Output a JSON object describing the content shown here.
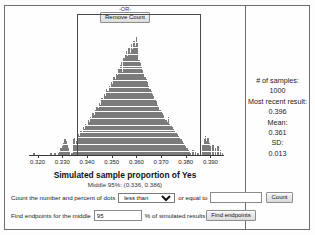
{
  "stats_panel": {
    "samples_label": "# of samples:",
    "samples_value": "1000",
    "recent_label": "Most recent result:",
    "recent_value": "0.396",
    "mean_label": "Mean:",
    "mean_value": "0.361",
    "sd_label": "SD:",
    "sd_value": "0.013"
  },
  "controls": {
    "count_prefix": "Count the number and percent of dots",
    "comparison_selected": "less than",
    "comparison_options": [
      "less than",
      "greater than"
    ],
    "or_equal_to": "or equal to",
    "count_value": "",
    "count_button": "Count",
    "or_divider": "-OR-",
    "find_prefix": "Find endpoints for the middle",
    "middle_pct": "95",
    "find_suffix": "% of simulated results",
    "find_button": "Find endpoints",
    "remove_button": "Remove Count"
  },
  "chart_data": {
    "type": "bar",
    "title": "Simulated sample proportion of Yes",
    "subtitle": "Middle 95%: (0.336, 0.386)",
    "xlabel": "Simulated sample proportion of Yes",
    "ylabel": "",
    "grid": false,
    "legend": "none",
    "xlim": [
      0.3165,
      0.3955
    ],
    "tick_values": [
      0.32,
      0.33,
      0.34,
      0.35,
      0.36,
      0.37,
      0.38,
      0.39
    ],
    "tick_labels": [
      "0.320",
      "0.330",
      "0.340",
      "0.350",
      "0.360",
      "0.370",
      "0.380",
      "0.390"
    ],
    "selection": {
      "low": 0.3358,
      "high": 0.3862,
      "label": "Middle 95%: (0.336, 0.386)"
    },
    "dot_value": 1,
    "bin_width": 0.001,
    "x": [
      0.3185,
      0.3255,
      0.327,
      0.3285,
      0.329,
      0.3295,
      0.33,
      0.3305,
      0.331,
      0.3315,
      0.332,
      0.3325,
      0.333,
      0.334,
      0.3345,
      0.335,
      0.3355,
      0.336,
      0.3365,
      0.337,
      0.3375,
      0.338,
      0.3385,
      0.339,
      0.3395,
      0.34,
      0.3405,
      0.341,
      0.3415,
      0.342,
      0.3425,
      0.343,
      0.3435,
      0.344,
      0.3445,
      0.345,
      0.3455,
      0.346,
      0.3465,
      0.347,
      0.3475,
      0.348,
      0.3485,
      0.349,
      0.3495,
      0.35,
      0.3505,
      0.351,
      0.3515,
      0.352,
      0.3525,
      0.353,
      0.3535,
      0.354,
      0.3545,
      0.355,
      0.3555,
      0.356,
      0.3565,
      0.357,
      0.3575,
      0.358,
      0.3585,
      0.359,
      0.3595,
      0.36,
      0.3605,
      0.361,
      0.3615,
      0.362,
      0.3625,
      0.363,
      0.3635,
      0.364,
      0.3645,
      0.365,
      0.3655,
      0.366,
      0.3665,
      0.367,
      0.3675,
      0.368,
      0.3685,
      0.369,
      0.3695,
      0.37,
      0.3705,
      0.371,
      0.3715,
      0.372,
      0.3725,
      0.373,
      0.3735,
      0.374,
      0.3745,
      0.375,
      0.3755,
      0.376,
      0.3765,
      0.377,
      0.3775,
      0.378,
      0.3785,
      0.379,
      0.3795,
      0.38,
      0.3805,
      0.381,
      0.3815,
      0.382,
      0.383,
      0.384,
      0.385,
      0.386,
      0.387,
      0.3875,
      0.388,
      0.3885,
      0.389,
      0.3895,
      0.39,
      0.391,
      0.392,
      0.393,
      0.394,
      0.395
    ],
    "counts": [
      1,
      1,
      1,
      1,
      2,
      4,
      5,
      7,
      9,
      8,
      6,
      4,
      2,
      1,
      9,
      10,
      6,
      8,
      12,
      11,
      14,
      13,
      16,
      15,
      18,
      17,
      20,
      19,
      22,
      21,
      24,
      23,
      26,
      28,
      27,
      30,
      29,
      33,
      32,
      35,
      34,
      38,
      37,
      40,
      39,
      42,
      41,
      45,
      44,
      47,
      46,
      50,
      52,
      54,
      48,
      56,
      58,
      60,
      57,
      62,
      59,
      64,
      61,
      66,
      63,
      68,
      65,
      55,
      53,
      51,
      49,
      47,
      45,
      44,
      42,
      40,
      38,
      37,
      35,
      34,
      32,
      31,
      29,
      28,
      26,
      25,
      24,
      23,
      21,
      20,
      19,
      22,
      18,
      17,
      16,
      15,
      14,
      13,
      12,
      11,
      10,
      9,
      8,
      7,
      6,
      5,
      4,
      3,
      2,
      1,
      3,
      2,
      1,
      12,
      6,
      9,
      11,
      8,
      10,
      7,
      5,
      6,
      4,
      5,
      3,
      1
    ]
  }
}
